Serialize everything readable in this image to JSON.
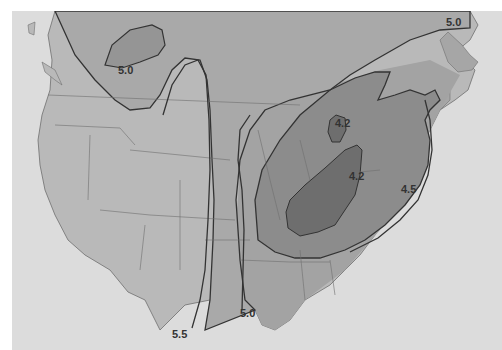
{
  "map": {
    "type": "isopleth",
    "region": "United States and southern Canada",
    "colors": {
      "background": "#dcdcdc",
      "ocean": "#dcdcdc",
      "land_light": "#b9b9b9",
      "land_mid": "#a6a6a6",
      "land_dark": "#8f8f8f",
      "zone_45": "#7f7f7f",
      "zone_42": "#6a6a6a",
      "water_bodies": "#e2e2e2",
      "contour_line": "#333333",
      "border_line": "#6f6f6f"
    },
    "contour_labels": [
      {
        "value": "5.0",
        "location": "northwest Canada (Alberta/Saskatchewan)"
      },
      {
        "value": "5.0",
        "location": "northeast Canada (Labrador)"
      },
      {
        "value": "4.2",
        "location": "southern Ontario / Lake Huron"
      },
      {
        "value": "4.2",
        "location": "Ohio / Pennsylvania"
      },
      {
        "value": "4.5",
        "location": "Atlantic coast off mid-Atlantic states"
      },
      {
        "value": "5.5",
        "location": "south Texas"
      },
      {
        "value": "5.0",
        "location": "Texas / Louisiana Gulf coast"
      }
    ]
  },
  "labels": {
    "nw_50": "5.0",
    "ne_50": "5.0",
    "ontario_42": "4.2",
    "ohio_42": "4.2",
    "atlantic_45": "4.5",
    "texas_55": "5.5",
    "gulf_50": "5.0"
  }
}
